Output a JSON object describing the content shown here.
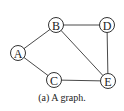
{
  "figure": {
    "caption": "(a) A graph.",
    "nodes": [
      {
        "id": "A",
        "label": "A",
        "x": 18,
        "y": 53
      },
      {
        "id": "B",
        "label": "B",
        "x": 56,
        "y": 25
      },
      {
        "id": "C",
        "label": "C",
        "x": 54,
        "y": 80
      },
      {
        "id": "D",
        "label": "D",
        "x": 107,
        "y": 25
      },
      {
        "id": "E",
        "label": "E",
        "x": 108,
        "y": 81
      }
    ],
    "edges": [
      {
        "from": "A",
        "to": "B"
      },
      {
        "from": "A",
        "to": "C"
      },
      {
        "from": "B",
        "to": "D"
      },
      {
        "from": "B",
        "to": "E"
      },
      {
        "from": "C",
        "to": "E"
      },
      {
        "from": "D",
        "to": "E"
      }
    ],
    "node_radius": 7.5,
    "colors": {
      "edge": "#4a4a4a",
      "node_stroke": "#333333",
      "text": "#222222"
    }
  }
}
